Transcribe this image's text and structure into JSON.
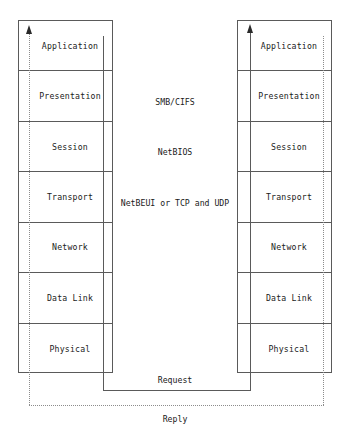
{
  "diagram": {
    "colors": {
      "background": "#ffffff",
      "box_stroke": "#5a5a5a",
      "dotted_stroke": "#8c8c8c",
      "text": "#1a1a1a",
      "arrowhead": "#2a2a2a"
    },
    "left_stack": {
      "name": "client-protocol-stack",
      "layers": [
        {
          "label": "Application"
        },
        {
          "label": "Presentation"
        },
        {
          "label": "Session"
        },
        {
          "label": "Transport"
        },
        {
          "label": "Network"
        },
        {
          "label": "Data Link"
        },
        {
          "label": "Physical"
        }
      ]
    },
    "right_stack": {
      "name": "server-protocol-stack",
      "layers": [
        {
          "label": "Application"
        },
        {
          "label": "Presentation"
        },
        {
          "label": "Session"
        },
        {
          "label": "Transport"
        },
        {
          "label": "Network"
        },
        {
          "label": "Data Link"
        },
        {
          "label": "Physical"
        }
      ]
    },
    "protocols": [
      {
        "label": "SMB/CIFS",
        "layer": "Presentation"
      },
      {
        "label": "NetBIOS",
        "layer": "Session"
      },
      {
        "label": "NetBEUI or TCP and UDP",
        "layer": "Transport"
      }
    ],
    "paths": [
      {
        "label": "Request",
        "style": "solid"
      },
      {
        "label": "Reply",
        "style": "dotted"
      }
    ]
  }
}
